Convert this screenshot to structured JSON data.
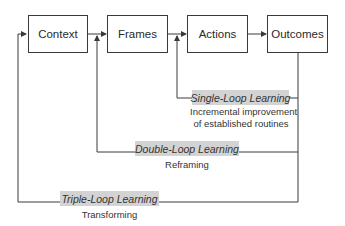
{
  "diagram": {
    "nodes": [
      {
        "id": "context",
        "label": "Context"
      },
      {
        "id": "frames",
        "label": "Frames"
      },
      {
        "id": "actions",
        "label": "Actions"
      },
      {
        "id": "outcomes",
        "label": "Outcomes"
      }
    ],
    "loops": [
      {
        "id": "single",
        "label": "Single-Loop Learning",
        "description_line1": "Incremental improvement",
        "description_line2": "of established routines",
        "from": "outcomes",
        "to": "actions"
      },
      {
        "id": "double",
        "label": "Double-Loop Learning",
        "description": "Reframing",
        "from": "outcomes",
        "to": "frames"
      },
      {
        "id": "triple",
        "label": "Triple-Loop Learning",
        "description": "Transforming",
        "from": "outcomes",
        "to": "context"
      }
    ],
    "colors": {
      "line": "#3a3a3a",
      "label_bg": "#d3d3d3"
    }
  }
}
